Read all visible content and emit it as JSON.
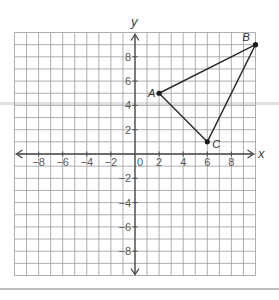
{
  "diagram": {
    "type": "coordinate-plane",
    "axes": {
      "x_label": "x",
      "y_label": "y",
      "origin_label": "0",
      "x_range": [
        -10,
        10
      ],
      "y_range": [
        -10,
        10
      ],
      "x_tick_labels": [
        "−8",
        "−6",
        "−4",
        "−2",
        "2",
        "4",
        "6",
        "8"
      ],
      "x_tick_values": [
        -8,
        -6,
        -4,
        -2,
        2,
        4,
        6,
        8
      ],
      "y_tick_labels": [
        "8",
        "6",
        "4",
        "2",
        "−2",
        "−4",
        "−6",
        "−8"
      ],
      "y_tick_values": [
        8,
        6,
        4,
        2,
        -2,
        -4,
        -6,
        -8
      ],
      "grid_step": 1
    },
    "points": [
      {
        "label": "A",
        "x": 2,
        "y": 5
      },
      {
        "label": "B",
        "x": 10,
        "y": 9
      },
      {
        "label": "C",
        "x": 6,
        "y": 1
      }
    ],
    "segments": [
      [
        "A",
        "B"
      ],
      [
        "B",
        "C"
      ],
      [
        "C",
        "A"
      ]
    ],
    "shape": "triangle ABC",
    "colors": {
      "grid": "#9a9a9a",
      "axis": "#4a4a4a",
      "triangle": "#2a2a2a",
      "scan_band": "#c8c8c8"
    }
  }
}
